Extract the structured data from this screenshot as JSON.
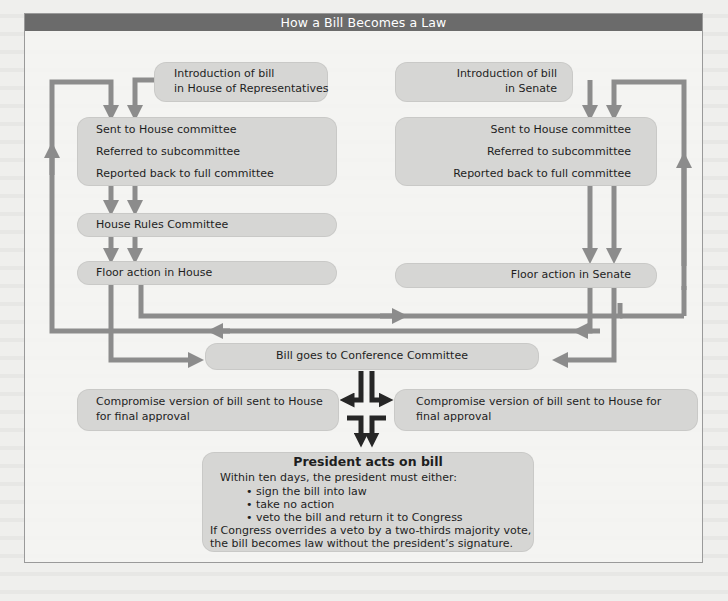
{
  "title": "How a Bill Becomes a Law",
  "house": {
    "intro": [
      "Introduction of bill",
      "in House of Representatives"
    ],
    "committee": [
      "Sent to House committee",
      "Referred to subcommittee",
      "Reported back to full committee"
    ],
    "rules": "House Rules Committee",
    "floor": "Floor action in House"
  },
  "senate": {
    "intro": [
      "Introduction of bill",
      "in Senate"
    ],
    "committee": [
      "Sent to House committee",
      "Referred to subcommittee",
      "Reported back to full committee"
    ],
    "floor": "Floor action in Senate"
  },
  "conference": "Bill goes to Conference Committee",
  "compromise_left": [
    "Compromise version of bill sent to House",
    "for final approval"
  ],
  "compromise_right": [
    "Compromise version of bill sent to House for",
    "final approval"
  ],
  "president": {
    "title": "President acts on bill",
    "intro": "Within ten days, the president must either:",
    "options": [
      "• sign the bill into law",
      "• take no action",
      "• veto the bill and return it to Congress"
    ],
    "override": [
      "If Congress overrides a veto by a two-thirds majority vote,",
      "the bill becomes law without the president’s signature."
    ]
  },
  "colors": {
    "title_bar": "#6b6b6b",
    "box_fill": "#d6d6d4",
    "flow_arrow": "#8c8c8c",
    "final_arrow": "#262626"
  }
}
